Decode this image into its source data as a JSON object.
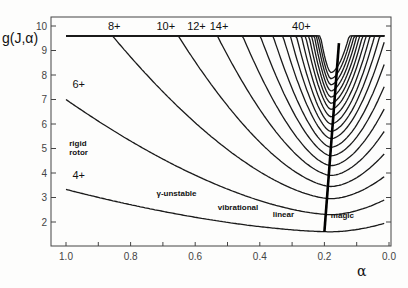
{
  "chart_data": {
    "type": "line",
    "title": "",
    "xlabel": "α",
    "ylabel": "g(J,α)",
    "xlim": [
      1.05,
      0.0
    ],
    "ylim": [
      1.0,
      10.2
    ],
    "x_reversed": true,
    "grid": false,
    "x_ticks": [
      1.0,
      0.8,
      0.6,
      0.4,
      0.2,
      0.0
    ],
    "x_tick_labels": [
      "1.0",
      "0.8",
      "0.6",
      "0.4",
      "0.2",
      "0.0"
    ],
    "x_minor_step": 0.1,
    "y_ticks": [
      2,
      3,
      4,
      5,
      6,
      7,
      8,
      9,
      10
    ],
    "y_tick_labels": [
      "2",
      "3",
      "4",
      "5",
      "6",
      "7",
      "8",
      "9",
      "10"
    ],
    "cap_value": 9.6,
    "alpha_min": 0.18,
    "series_model": "g = gmin + (g_left - gmin)*((α-α_min)/(1-α_min))^1.6 for α≥α_min; g = gmin + (g_right - gmin)*((α_min-α)/α_min)^1.8 for α<α_min; capped at cap_value",
    "series": [
      {
        "name": "4+",
        "J": 4,
        "gmin": 1.6,
        "g_left": 3.33,
        "g_right": 2.0
      },
      {
        "name": "6+",
        "J": 6,
        "gmin": 2.3,
        "g_left": 7.0,
        "g_right": 3.0
      },
      {
        "name": "8+",
        "J": 8,
        "gmin": 2.95,
        "g_left": 12.0,
        "g_right": 4.0
      },
      {
        "name": "10+",
        "J": 10,
        "gmin": 3.45,
        "g_left": 18.3,
        "g_right": 5.0
      },
      {
        "name": "12+",
        "J": 12,
        "gmin": 3.9,
        "g_left": 26.0,
        "g_right": 6.0
      },
      {
        "name": "14+",
        "J": 14,
        "gmin": 4.3,
        "g_left": 35.0,
        "g_right": 7.0
      },
      {
        "name": "16+",
        "J": 16,
        "gmin": 4.7,
        "g_left": 45.3,
        "g_right": 8.0
      },
      {
        "name": "18+",
        "J": 18,
        "gmin": 5.05,
        "g_left": 57.0,
        "g_right": 9.0
      },
      {
        "name": "20+",
        "J": 20,
        "gmin": 5.4,
        "g_left": 70.0,
        "g_right": 10.0
      },
      {
        "name": "22+",
        "J": 22,
        "gmin": 5.7,
        "g_left": 84.3,
        "g_right": 11.0
      },
      {
        "name": "24+",
        "J": 24,
        "gmin": 6.0,
        "g_left": 100.0,
        "g_right": 12.0
      },
      {
        "name": "26+",
        "J": 26,
        "gmin": 6.3,
        "g_left": 117.0,
        "g_right": 13.0
      },
      {
        "name": "28+",
        "J": 28,
        "gmin": 6.6,
        "g_left": 135.3,
        "g_right": 14.0
      },
      {
        "name": "30+",
        "J": 30,
        "gmin": 6.85,
        "g_left": 155.0,
        "g_right": 15.0
      },
      {
        "name": "32+",
        "J": 32,
        "gmin": 7.1,
        "g_left": 176.0,
        "g_right": 16.0
      },
      {
        "name": "34+",
        "J": 34,
        "gmin": 7.35,
        "g_left": 198.3,
        "g_right": 17.0
      },
      {
        "name": "36+",
        "J": 36,
        "gmin": 7.6,
        "g_left": 222.0,
        "g_right": 18.0
      },
      {
        "name": "38+",
        "J": 38,
        "gmin": 7.85,
        "g_left": 247.0,
        "g_right": 19.0
      },
      {
        "name": "40+",
        "J": 40,
        "gmin": 8.1,
        "g_left": 273.3,
        "g_right": 20.0
      }
    ],
    "curve_labels": [
      {
        "text": "4+",
        "alpha": 0.98,
        "g": 3.75
      },
      {
        "text": "6+",
        "alpha": 0.98,
        "g": 7.45
      },
      {
        "text": "8+",
        "alpha": 0.87,
        "g": 9.85
      },
      {
        "text": "10+",
        "alpha": 0.72,
        "g": 9.85
      },
      {
        "text": "12+",
        "alpha": 0.625,
        "g": 9.85
      },
      {
        "text": "14+",
        "alpha": 0.555,
        "g": 9.85
      },
      {
        "text": "40+",
        "alpha": 0.3,
        "g": 9.85
      }
    ],
    "magic_line": {
      "label": "magic",
      "points": [
        [
          0.2,
          1.6
        ],
        [
          0.155,
          9.3
        ]
      ]
    },
    "annotations": [
      {
        "text": "rigid",
        "alpha": 0.99,
        "g": 5.1
      },
      {
        "text": "rotor",
        "alpha": 0.99,
        "g": 4.75
      },
      {
        "text": "γ-unstable",
        "alpha": 0.72,
        "g": 3.05
      },
      {
        "text": "vibrational",
        "alpha": 0.53,
        "g": 2.5
      },
      {
        "text": "linear",
        "alpha": 0.36,
        "g": 2.2
      },
      {
        "text": "magic",
        "alpha": 0.18,
        "g": 2.15
      }
    ]
  }
}
